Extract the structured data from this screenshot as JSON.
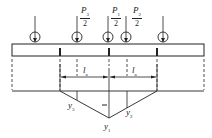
{
  "diagram": {
    "type": "influence-line / load distribution diagram",
    "loads": [
      {
        "id": "load-1",
        "x": 35,
        "label": null
      },
      {
        "id": "load-2",
        "x": 77,
        "label": {
          "symbol": "P",
          "sub": "3",
          "den": "2"
        }
      },
      {
        "id": "load-3",
        "x": 108,
        "label": {
          "symbol": "P",
          "sub": "1",
          "den": "2"
        }
      },
      {
        "id": "load-4",
        "x": 126,
        "label": {
          "symbol": "P",
          "sub": "2",
          "den": "2"
        }
      },
      {
        "id": "load-5",
        "x": 163,
        "label": null
      }
    ],
    "span_labels": [
      {
        "symbol": "l",
        "sub": "a"
      },
      {
        "symbol": "l",
        "sub": "a"
      }
    ],
    "ordinates": {
      "y3": {
        "symbol": "y",
        "sub": "3"
      },
      "y1": {
        "symbol": "y",
        "sub": "1"
      },
      "y2": {
        "symbol": "y",
        "sub": "2"
      }
    },
    "center_mark": "–",
    "colors": {
      "line": "#222222",
      "background": "#ffffff"
    }
  }
}
